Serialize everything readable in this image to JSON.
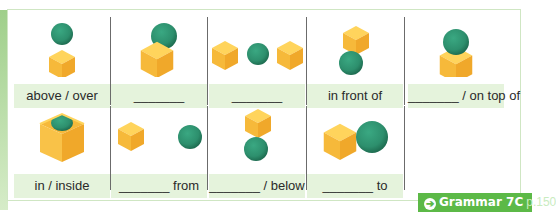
{
  "colors": {
    "cube": "#f5b83a",
    "sphere": "#2d8f6d",
    "label_bg": "#e5f3dc",
    "badge_bg": "#5cb947"
  },
  "row1": [
    {
      "label": "above / over",
      "scene": "sphere-above-cube"
    },
    {
      "label": "_______",
      "scene": "sphere-behind-cube"
    },
    {
      "label": "_______",
      "scene": "sphere-between-cubes"
    },
    {
      "label": "in front of",
      "scene": "sphere-in-front-of-cube"
    },
    {
      "label": "_______ / on top of",
      "scene": "sphere-on-cube"
    }
  ],
  "row2": [
    {
      "label": "in / inside",
      "scene": "sphere-inside-cube"
    },
    {
      "label": "_______ from",
      "scene": "cube-far-from-sphere"
    },
    {
      "label": "_______ / below",
      "scene": "sphere-below-cube"
    },
    {
      "label": "_______ to",
      "scene": "cube-next-to-sphere"
    }
  ],
  "badge": {
    "arrow": "➔",
    "title": "Grammar 7C",
    "page": "p.150"
  }
}
